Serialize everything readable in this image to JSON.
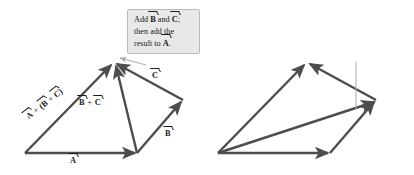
{
  "figure": {
    "background": "#ffffff",
    "arrow_color": "#4d4d4d",
    "leader_color": "#b0b0b0",
    "callout_fill": "#e8e8e8",
    "callout_border": "#b9b9b9",
    "text_color": "#1c1c1c"
  },
  "panels": [
    {
      "id": "left",
      "callout": {
        "lines": [
          {
            "parts": [
              {
                "t": "text",
                "v": "Add "
              },
              {
                "t": "vec",
                "v": "B"
              },
              {
                "t": "text",
                "v": " and "
              },
              {
                "t": "vec",
                "v": "C"
              },
              {
                "t": "text",
                "v": ";"
              }
            ]
          },
          {
            "parts": [
              {
                "t": "text",
                "v": "then add the"
              }
            ]
          },
          {
            "parts": [
              {
                "t": "text",
                "v": "result to "
              },
              {
                "t": "vec",
                "v": "A"
              },
              {
                "t": "text",
                "v": "."
              }
            ]
          }
        ]
      },
      "labels": {
        "sum": {
          "parts": [
            {
              "t": "vec",
              "v": "A"
            },
            {
              "t": "op",
              "v": " + "
            },
            {
              "t": "text",
              "v": "("
            },
            {
              "t": "vec",
              "v": "B"
            },
            {
              "t": "op",
              "v": " + "
            },
            {
              "t": "vec",
              "v": "C"
            },
            {
              "t": "text",
              "v": ")"
            }
          ]
        },
        "inner": {
          "parts": [
            {
              "t": "vec",
              "v": "B"
            },
            {
              "t": "op",
              "v": " + "
            },
            {
              "t": "vec",
              "v": "C"
            }
          ]
        },
        "c": {
          "parts": [
            {
              "t": "vec",
              "v": "C"
            }
          ]
        },
        "b": {
          "parts": [
            {
              "t": "vec",
              "v": "B"
            }
          ]
        },
        "a": {
          "parts": [
            {
              "t": "vec",
              "v": "A"
            }
          ]
        }
      }
    },
    {
      "id": "right",
      "callout": {
        "lines": [
          {
            "parts": [
              {
                "t": "text",
                "v": "Add "
              },
              {
                "t": "vec",
                "v": "A"
              },
              {
                "t": "text",
                "v": " and "
              },
              {
                "t": "vec",
                "v": "B"
              },
              {
                "t": "text",
                "v": ";"
              }
            ]
          },
          {
            "parts": [
              {
                "t": "text",
                "v": "then add "
              },
              {
                "t": "vec",
                "v": "C"
              },
              {
                "t": "text",
                "v": " to"
              }
            ]
          },
          {
            "parts": [
              {
                "t": "text",
                "v": "the result."
              }
            ]
          }
        ]
      },
      "labels": {
        "sum": {
          "parts": [
            {
              "t": "text",
              "v": "("
            },
            {
              "t": "vec",
              "v": "A"
            },
            {
              "t": "op",
              "v": " + "
            },
            {
              "t": "vec",
              "v": "B"
            },
            {
              "t": "text",
              "v": ")"
            },
            {
              "t": "op",
              "v": " + "
            },
            {
              "t": "vec",
              "v": "C"
            }
          ]
        },
        "inner": {
          "parts": [
            {
              "t": "vec",
              "v": "A"
            },
            {
              "t": "op",
              "v": " + "
            },
            {
              "t": "vec",
              "v": "B"
            }
          ]
        },
        "c": {
          "parts": [
            {
              "t": "vec",
              "v": "C"
            }
          ]
        },
        "b": {
          "parts": [
            {
              "t": "vec",
              "v": "B"
            }
          ]
        },
        "a": {
          "parts": [
            {
              "t": "vec",
              "v": "A"
            }
          ]
        }
      }
    }
  ],
  "geometry": {
    "left": {
      "origin": [
        25,
        153
      ],
      "a_tip": [
        137,
        153
      ],
      "b_tip": [
        183,
        100
      ],
      "c_tip": [
        114,
        62
      ],
      "note": "A from origin to a_tip; B from a_tip to b_tip; C from b_tip to c_tip; B+C from a_tip to c_tip; A+(B+C) from origin to c_tip"
    },
    "right": {
      "origin": [
        218,
        153
      ],
      "a_tip": [
        330,
        153
      ],
      "b_tip": [
        376,
        100
      ],
      "c_tip": [
        307,
        62
      ],
      "note": "A from origin to a_tip; B from a_tip to b_tip; A+B from origin to b_tip; C from b_tip to c_tip; (A+B)+C from origin to c_tip"
    }
  }
}
